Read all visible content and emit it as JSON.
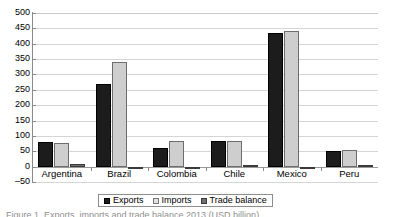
{
  "chart_data": {
    "type": "bar",
    "title": "",
    "subtitle": "",
    "xlabel": "",
    "ylabel": "",
    "ylim": [
      -50,
      500
    ],
    "y_ticks": [
      500,
      450,
      400,
      350,
      300,
      250,
      200,
      150,
      100,
      50,
      0,
      -50
    ],
    "y_tick_labels": [
      "500",
      "450",
      "400",
      "350",
      "300",
      "250",
      "200",
      "150",
      "100",
      "50",
      "0",
      "–50"
    ],
    "grid": true,
    "legend_position": "bottom",
    "categories": [
      "Argentina",
      "Brazil",
      "Colombia",
      "Chile",
      "Mexico",
      "Peru"
    ],
    "series": [
      {
        "name": "Exports",
        "color": "#1c1c1c",
        "values": [
          80,
          270,
          62,
          85,
          435,
          50
        ]
      },
      {
        "name": "Imports",
        "color": "#cecece",
        "values": [
          78,
          340,
          85,
          82,
          440,
          55
        ]
      },
      {
        "name": "Trade balance",
        "color": "#707070",
        "values": [
          10,
          -5,
          -8,
          5,
          -6,
          2
        ]
      }
    ]
  },
  "legend": {
    "items": [
      {
        "label": "Exports",
        "swatch": "exports-swatch"
      },
      {
        "label": "Imports",
        "swatch": "imports-swatch"
      },
      {
        "label": "Trade balance",
        "swatch": "trade-balance-swatch"
      }
    ]
  },
  "caption": {
    "text": "Figure 1. Exports, imports and trade balance 2013 (USD billion)"
  }
}
